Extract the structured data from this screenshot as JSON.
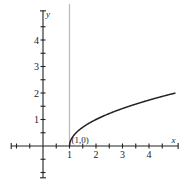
{
  "chart_data": {
    "type": "line",
    "title": "",
    "xlabel": "x",
    "ylabel": "y",
    "xlim": [
      -1.5,
      5.5
    ],
    "ylim": [
      -1.5,
      5.5
    ],
    "grid": false,
    "x_tick_labels": [
      "1",
      "2",
      "3",
      "4"
    ],
    "x_ticks": [
      1,
      2,
      3,
      4
    ],
    "x_minor_ticks": [
      -1.5,
      -1,
      -0.5,
      0.5,
      1.5,
      2.5,
      3.5,
      4.5,
      5.1
    ],
    "y_tick_labels": [
      "1",
      "2",
      "3",
      "4"
    ],
    "y_ticks": [
      1,
      2,
      3,
      4
    ],
    "y_minor_ticks": [
      -1.5,
      -1,
      -0.5,
      0.5,
      1.5,
      2.5,
      3.5,
      4.5,
      5.1
    ],
    "series": [
      {
        "name": "y = sqrt(x - 1)",
        "x": [
          1,
          1.1,
          1.25,
          1.5,
          2,
          2.5,
          3,
          3.5,
          4,
          4.5,
          5
        ],
        "y": [
          0,
          0.316,
          0.5,
          0.707,
          1,
          1.225,
          1.414,
          1.581,
          1.732,
          1.871,
          2
        ]
      }
    ],
    "vertical_guide": {
      "x": 1,
      "color": "#b8b8b8"
    },
    "annotations": [
      {
        "text": "(1,0)",
        "x": 1,
        "y": 0
      }
    ]
  }
}
